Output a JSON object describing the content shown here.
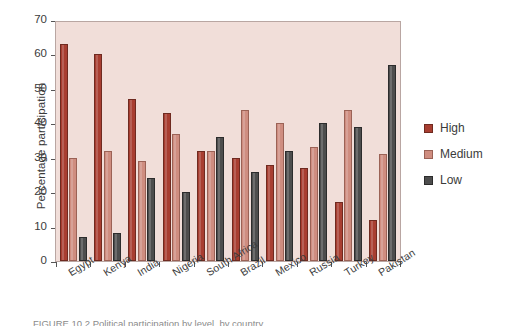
{
  "chart_data": {
    "type": "bar",
    "title": "",
    "xlabel": "",
    "ylabel": "Percentage participation",
    "ylim": [
      0,
      70
    ],
    "yticks": [
      0,
      10,
      20,
      30,
      40,
      50,
      60,
      70
    ],
    "grid": false,
    "legend_position": "right",
    "plot_background": "#f1ded9",
    "categories": [
      "Egypt",
      "Kenya",
      "India",
      "Nigeria",
      "South Africa",
      "Brazil",
      "Mexico",
      "Russia",
      "Turkey",
      "Pakistan"
    ],
    "series": [
      {
        "name": "High",
        "color": "#a83e31",
        "values": [
          63,
          60,
          47,
          43,
          32,
          30,
          28,
          27,
          17,
          12
        ]
      },
      {
        "name": "Medium",
        "color": "#cf8d80",
        "values": [
          30,
          32,
          29,
          37,
          32,
          44,
          40,
          33,
          44,
          31
        ]
      },
      {
        "name": "Low",
        "color": "#4d4d4d",
        "values": [
          7,
          8,
          24,
          20,
          36,
          26,
          32,
          40,
          39,
          57
        ]
      }
    ]
  },
  "axis": {
    "y_title": "Percentage participation",
    "y_ticks": [
      "70",
      "60",
      "50",
      "40",
      "30",
      "20",
      "10",
      "0"
    ]
  },
  "legend": {
    "items": [
      {
        "label": "High",
        "swatch": "high"
      },
      {
        "label": "Medium",
        "swatch": "medium"
      },
      {
        "label": "Low",
        "swatch": "low"
      }
    ]
  },
  "caption": {
    "text": "FIGURE 10.2   Political participation by level, by country"
  }
}
